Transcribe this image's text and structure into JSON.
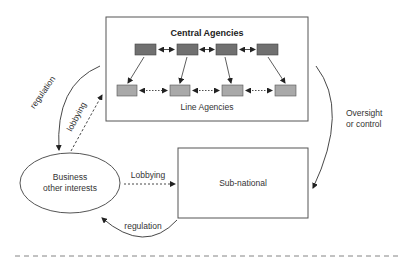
{
  "diagram": {
    "central_box": {
      "title": "Central Agencies",
      "subtitle": "Line Agencies",
      "central_agency_count": 4,
      "line_agency_count": 4
    },
    "business_node": {
      "line1": "Business",
      "line2": "other interests"
    },
    "subnational_node": {
      "label": "Sub-national"
    },
    "edges": {
      "regulation_top": "regulation",
      "lobbying_top": "lobbying",
      "oversight_line1": "Oversight",
      "oversight_line2": "or control",
      "lobbying_mid": "Lobbying",
      "regulation_bottom": "regulation"
    },
    "colors": {
      "central_agency_fill": "#707070",
      "line_agency_fill": "#a9a9a9",
      "stroke": "#444444"
    }
  }
}
